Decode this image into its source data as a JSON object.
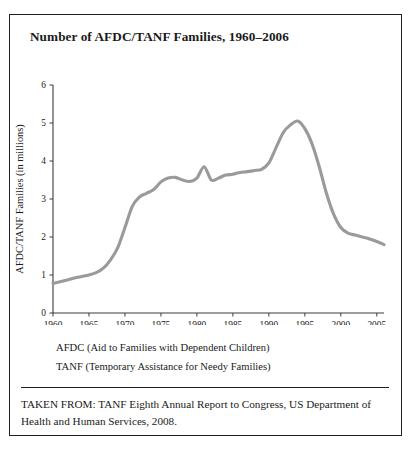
{
  "figure": {
    "title": "Number of AFDC/TANF Families, 1960–2006",
    "legend": [
      "AFDC (Aid to Families with Dependent Children)",
      "TANF (Temporary Assistance for Needy Families)"
    ],
    "source": "TAKEN FROM: TANF Eighth Annual Report to Congress, US Department of Health and Human Services, 2008.",
    "colors": {
      "line": "#9a9a9a",
      "axis": "#3c3c3c",
      "border": "#231f20",
      "background": "#ffffff"
    }
  },
  "chart_data": {
    "type": "line",
    "title": "Number of AFDC/TANF Families, 1960–2006",
    "xlabel": "",
    "ylabel": "AFDC/TANF Families (in millions)",
    "xlim": [
      1960,
      2006
    ],
    "ylim": [
      0,
      6
    ],
    "grid": false,
    "legend_position": "below-plot",
    "ytick_labels": [
      "0",
      "1",
      "2",
      "3",
      "4",
      "5",
      "6"
    ],
    "ytick_values": [
      0,
      1,
      2,
      3,
      4,
      5,
      6
    ],
    "xtick_labels": [
      "1960",
      "1965",
      "1970",
      "1975",
      "1980",
      "1985",
      "1990",
      "1995",
      "2000",
      "2005"
    ],
    "xtick_values": [
      1960,
      1965,
      1970,
      1975,
      1980,
      1985,
      1990,
      1995,
      2000,
      2005
    ],
    "series": [
      {
        "name": "AFDC/TANF Families (in millions)",
        "x": [
          1960,
          1961,
          1962,
          1963,
          1964,
          1965,
          1966,
          1967,
          1968,
          1969,
          1970,
          1971,
          1972,
          1973,
          1974,
          1975,
          1976,
          1977,
          1978,
          1979,
          1980,
          1981,
          1982,
          1983,
          1984,
          1985,
          1986,
          1987,
          1988,
          1989,
          1990,
          1991,
          1992,
          1993,
          1994,
          1995,
          1996,
          1997,
          1998,
          1999,
          2000,
          2001,
          2002,
          2003,
          2004,
          2005,
          2006
        ],
        "values": [
          0.78,
          0.82,
          0.87,
          0.92,
          0.96,
          1.0,
          1.06,
          1.18,
          1.4,
          1.72,
          2.25,
          2.8,
          3.05,
          3.15,
          3.25,
          3.45,
          3.55,
          3.57,
          3.5,
          3.46,
          3.55,
          3.85,
          3.5,
          3.55,
          3.63,
          3.65,
          3.7,
          3.72,
          3.75,
          3.78,
          3.95,
          4.35,
          4.75,
          4.95,
          5.05,
          4.85,
          4.45,
          3.85,
          3.15,
          2.6,
          2.25,
          2.1,
          2.05,
          2.0,
          1.95,
          1.88,
          1.8
        ]
      }
    ],
    "annotations": [
      {
        "text": "peak near 1994 at about 5.0 million",
        "x": 1994,
        "y": 5.05
      },
      {
        "text": "sharp spike in 1981",
        "x": 1981,
        "y": 3.85
      }
    ]
  }
}
